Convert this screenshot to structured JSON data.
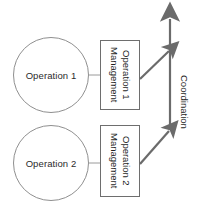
{
  "diagram": {
    "colors": {
      "node_stroke": "#8f8f8f",
      "box_stroke": "#6e6e6e",
      "arrow": "#6b6b6b",
      "connector": "#9a9a9a",
      "text": "#1f1f1f",
      "background": "#ffffff"
    },
    "circles": [
      {
        "id": "operation-1",
        "label": "Operation 1"
      },
      {
        "id": "operation-2",
        "label": "Operation 2"
      }
    ],
    "boxes": [
      {
        "id": "operation-1-management",
        "line1": "Operation 1",
        "line2": "Management"
      },
      {
        "id": "operation-2-management",
        "line1": "Operation 2",
        "line2": "Management"
      }
    ],
    "axis": {
      "id": "coordination",
      "label": "Coordination"
    },
    "arrows": [
      {
        "id": "coordination-axis-arrow",
        "direction": "up"
      },
      {
        "id": "operation-1-to-coordination",
        "direction": "up-right"
      },
      {
        "id": "operation-2-to-coordination",
        "direction": "up-right"
      }
    ]
  }
}
